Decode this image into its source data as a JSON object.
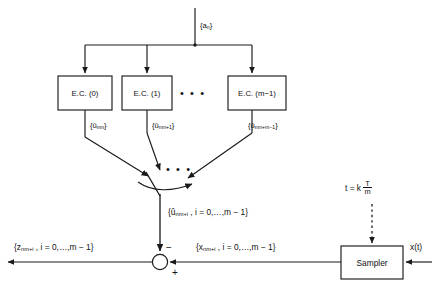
{
  "diagram": {
    "stroke_color": "#1a1a1a",
    "background": "#ffffff"
  },
  "input": {
    "label": "{a",
    "label_sub": "n",
    "label_close": "}"
  },
  "encoders": [
    {
      "name": "ec-0",
      "label": "E.C. (0)"
    },
    {
      "name": "ec-1",
      "label": "E.C. (1)"
    },
    {
      "name": "ec-m-1",
      "label": "E.C. (m−1)"
    }
  ],
  "ellipsis": {
    "between_boxes": "• • •",
    "above_commutator": "• • •"
  },
  "encoder_outputs": [
    {
      "name": "u-nm",
      "open": "{û",
      "sub": "nm",
      "close": "}"
    },
    {
      "name": "u-nm-1",
      "open": "{û",
      "sub": "nm+1",
      "close": "}"
    },
    {
      "name": "u-nm-m-1",
      "open": "{û",
      "sub": "nm+m−1",
      "close": "}"
    }
  ],
  "commutator_output": {
    "open": "{û",
    "sub": "nm+i",
    "rest": " , i = 0,…,m − 1}"
  },
  "error_output": {
    "open": "{z",
    "sub": "nm+i",
    "rest": " , i = 0,…,m − 1}"
  },
  "sampled_signal": {
    "open": "{x",
    "sub": "nm+i",
    "rest": " , i = 0,…,m − 1}"
  },
  "sampler": {
    "label": "Sampler"
  },
  "clock": {
    "prefix": "t = k ",
    "numerator": "T",
    "denominator": "m"
  },
  "analog_input": {
    "label": "x(t)"
  },
  "summing_junction": {
    "minus": "−",
    "plus": "+"
  }
}
